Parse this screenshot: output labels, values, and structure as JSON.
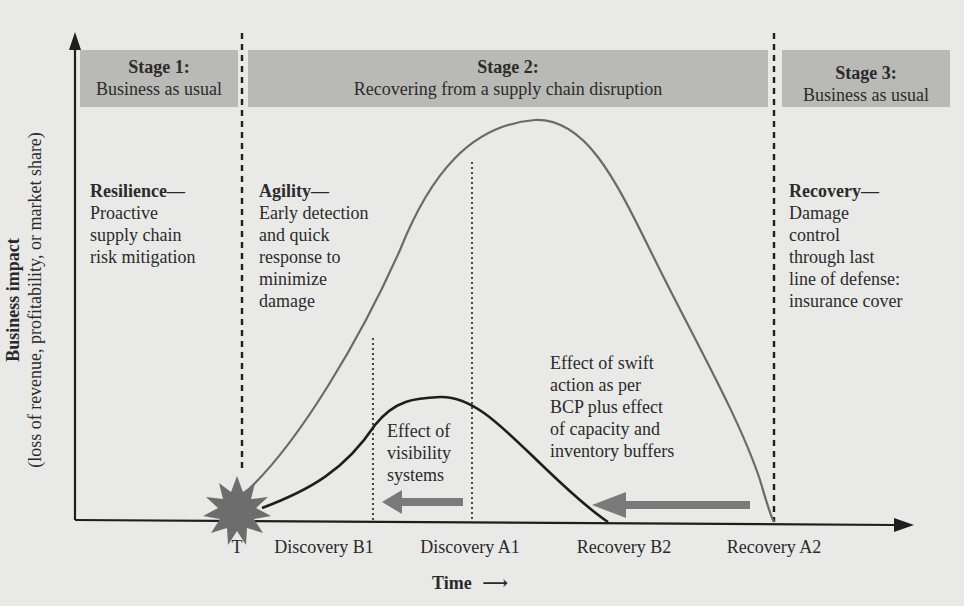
{
  "stages": [
    {
      "title": "Stage 1:",
      "subtitle": "Business as usual"
    },
    {
      "title": "Stage 2:",
      "subtitle": "Recovering from a supply chain disruption"
    },
    {
      "title": "Stage 3:",
      "subtitle": "Business as usual"
    }
  ],
  "y_axis": {
    "line1": "Business impact",
    "line2": "(loss of revenue, profitability, or market share)"
  },
  "x_axis": {
    "label": "Time",
    "arrow": "⟶",
    "ticks": [
      "T",
      "Discovery B1",
      "Discovery A1",
      "Recovery B2",
      "Recovery A2"
    ]
  },
  "annotations": {
    "resilience": {
      "heading": "Resilience—",
      "lines": [
        "Proactive",
        "supply chain",
        "risk mitigation"
      ]
    },
    "agility": {
      "heading": "Agility—",
      "lines": [
        "Early detection",
        "and quick",
        "response to",
        "minimize",
        "damage"
      ]
    },
    "recovery": {
      "heading": "Recovery—",
      "lines": [
        "Damage",
        "control",
        "through last",
        "line of defense:",
        "insurance cover"
      ]
    },
    "visibility": {
      "lines": [
        "Effect of",
        "visibility",
        "systems"
      ]
    },
    "swift_action": {
      "lines": [
        "Effect of swift",
        "action as per",
        "BCP plus effect",
        "of capacity and",
        "inventory buffers"
      ]
    }
  },
  "colors": {
    "background": "#e9e9e7",
    "stage_band": "#b9b9b6",
    "axis": "#1e1e1e",
    "curve_large": "#6a6a6a",
    "curve_small": "#1e1e1e",
    "arrow_fill": "#7a7a7a",
    "starburst": "#6d6d6d"
  }
}
